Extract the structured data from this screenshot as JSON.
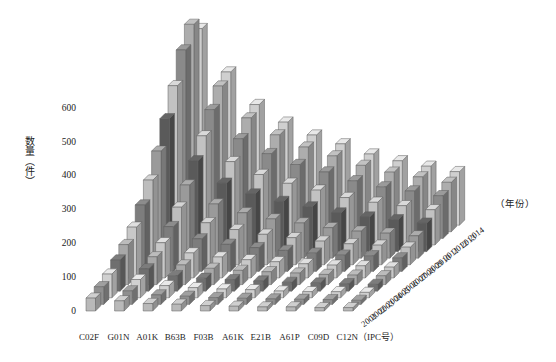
{
  "chart_data": {
    "type": "bar",
    "render": "3d-bar",
    "title": "",
    "xlabel": "(IPC号)",
    "ylabel": "数量（件）",
    "zlabel": "（年份）",
    "ylim": [
      0,
      650
    ],
    "yticks": [
      0,
      100,
      200,
      300,
      400,
      500,
      600
    ],
    "ytick_labels": [
      "0",
      "100",
      "200",
      "300",
      "400",
      "500",
      "600"
    ],
    "grid": false,
    "legend": false,
    "categories": [
      "C02F",
      "G01N",
      "A01K",
      "B63B",
      "F03B",
      "A61K",
      "E21B",
      "A61P",
      "C09D",
      "C12N"
    ],
    "category_axis_label": "C12N（IPC号）",
    "depth_categories": [
      "2001",
      "2002",
      "2003",
      "2004",
      "2005",
      "2006",
      "2007",
      "2008",
      "2009",
      "2010",
      "2011",
      "2012",
      "2013",
      "2014"
    ],
    "series": [
      {
        "name": "2001",
        "values": [
          38,
          30,
          22,
          20,
          16,
          14,
          12,
          12,
          10,
          10
        ]
      },
      {
        "name": "2002",
        "values": [
          52,
          40,
          28,
          24,
          20,
          18,
          16,
          15,
          14,
          12
        ]
      },
      {
        "name": "2003",
        "values": [
          70,
          54,
          36,
          30,
          26,
          24,
          20,
          18,
          18,
          16
        ]
      },
      {
        "name": "2004",
        "values": [
          92,
          66,
          46,
          38,
          34,
          30,
          26,
          24,
          22,
          20
        ]
      },
      {
        "name": "2005",
        "values": [
          118,
          82,
          58,
          48,
          42,
          38,
          34,
          30,
          28,
          26
        ]
      },
      {
        "name": "2006",
        "values": [
          150,
          104,
          74,
          62,
          54,
          48,
          42,
          38,
          36,
          32
        ]
      },
      {
        "name": "2007",
        "values": [
          196,
          132,
          96,
          80,
          70,
          62,
          54,
          48,
          46,
          40
        ]
      },
      {
        "name": "2008",
        "values": [
          250,
          170,
          124,
          104,
          90,
          80,
          70,
          62,
          58,
          52
        ]
      },
      {
        "name": "2009",
        "values": [
          316,
          216,
          160,
          134,
          116,
          104,
          90,
          80,
          74,
          66
        ]
      },
      {
        "name": "2010",
        "values": [
          392,
          268,
          202,
          170,
          148,
          132,
          114,
          102,
          94,
          84
        ]
      },
      {
        "name": "2011",
        "values": [
          470,
          322,
          246,
          208,
          182,
          162,
          140,
          126,
          116,
          104
        ]
      },
      {
        "name": "2012",
        "values": [
          556,
          380,
          294,
          250,
          218,
          196,
          170,
          152,
          140,
          126
        ]
      },
      {
        "name": "2013",
        "values": [
          612,
          430,
          336,
          286,
          250,
          224,
          196,
          176,
          162,
          146
        ]
      },
      {
        "name": "2014",
        "values": [
          580,
          452,
          356,
          304,
          266,
          240,
          210,
          190,
          174,
          158
        ]
      }
    ]
  },
  "style": {
    "bar_front_shades": [
      "#b9b9b9",
      "#8f8f8f",
      "#d0d0d0",
      "#6f6f6f",
      "#a8a8a8",
      "#c8c8c8",
      "#7d7d7d",
      "#bdbdbd",
      "#9a9a9a",
      "#5a5a5a",
      "#c2c2c2",
      "#8a8a8a",
      "#adadad",
      "#cfcfcf"
    ],
    "axis_color": "#333333",
    "background": "#ffffff"
  }
}
